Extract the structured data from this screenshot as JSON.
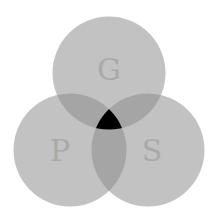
{
  "diagram": {
    "type": "venn-3",
    "background": "#ffffff",
    "single_region_color": "#c2c2c2",
    "double_overlap_color": "#a5a5a5",
    "triple_overlap_color": "#000000",
    "label_color": "#a9a9a9",
    "sets": [
      {
        "label": "G",
        "position": "top"
      },
      {
        "label": "P",
        "position": "bottom-left"
      },
      {
        "label": "S",
        "position": "bottom-right"
      }
    ]
  }
}
